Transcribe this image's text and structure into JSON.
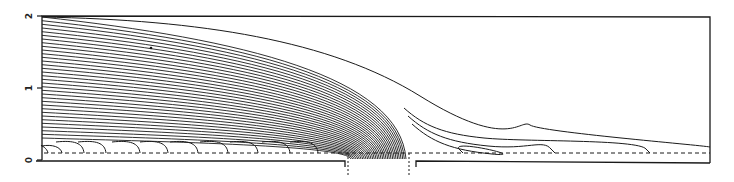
{
  "figure": {
    "type": "streamline-diagram",
    "line_color": "#1a1a1a",
    "background": "#ffffff"
  },
  "axis": {
    "y_ticks": [
      {
        "value": 2,
        "label": "2"
      },
      {
        "value": 1,
        "label": "1"
      },
      {
        "value": 0,
        "label": "0"
      }
    ],
    "y_range": [
      0,
      2
    ]
  },
  "frame": {
    "x0": 42,
    "x1": 710,
    "y_top": 16,
    "y_bottom": 160
  },
  "dashed_line": {
    "y": 153
  },
  "base": {
    "y": 161,
    "gap_left_x": 345,
    "gap_right_x": 412,
    "step_y": 167,
    "marker_bottom_y": 176
  },
  "streamlines": {
    "converging_count": 34,
    "top_line_start_y": 17,
    "bottom_line_start_y": 138,
    "gap_center_x": 378,
    "outer_lines": [
      {
        "end_x": 710,
        "end_y": 147
      },
      {
        "end_x": 650,
        "end_y": 153
      },
      {
        "end_x": 555,
        "end_y": 153
      },
      {
        "end_x": 463,
        "end_y": 153
      }
    ],
    "hooks_x": [
      48,
      62,
      84,
      106,
      140,
      168,
      198,
      228,
      258,
      290,
      318
    ]
  },
  "annotations": {
    "dot": {
      "x": 151,
      "y": 48
    }
  }
}
